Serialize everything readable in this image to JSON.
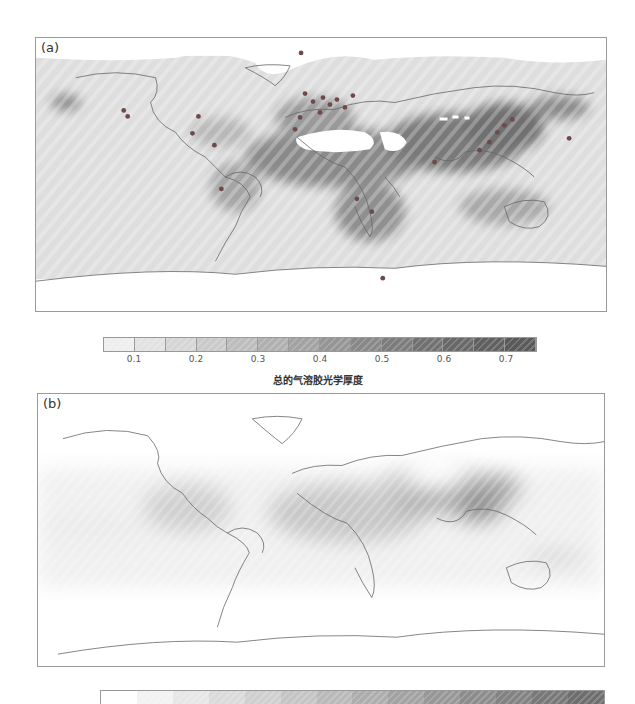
{
  "figure": {
    "panel_a": {
      "label": "(a)",
      "description": "Observed total aerosol optical depth world map with ground station markers",
      "station_color": "#6e4a4a"
    },
    "panel_b": {
      "label": "(b)",
      "description": "Modeled aerosol optical depth world map"
    },
    "colorbar_a": {
      "title": "总的气溶胶光学厚度",
      "ticks": [
        "0.1",
        "0.2",
        "0.3",
        "0.4",
        "0.5",
        "0.6",
        "0.7"
      ],
      "range": [
        0.05,
        0.75
      ],
      "colors": [
        "#eeeeee",
        "#e2e2e2",
        "#d6d6d6",
        "#cacaca",
        "#bdbdbd",
        "#b0b0b0",
        "#a2a2a2",
        "#959595",
        "#888888",
        "#7c7c7c",
        "#717171",
        "#686868",
        "#606060",
        "#595959"
      ]
    },
    "colorbar_b": {
      "colors": [
        "#ffffff",
        "#f2f2f2",
        "#e6e6e6",
        "#dadada",
        "#cfcfcf",
        "#c4c4c4",
        "#b9b9b9",
        "#adadad",
        "#a2a2a2",
        "#979797",
        "#8c8c8c",
        "#828282",
        "#787878",
        "#6e6e6e"
      ]
    }
  },
  "chart_data": {
    "type": "heatmap",
    "title": "",
    "panels": [
      "(a)",
      "(b)"
    ],
    "colorbar_label": "总的气溶胶光学厚度",
    "colorbar_ticks": [
      0.1,
      0.2,
      0.3,
      0.4,
      0.5,
      0.6,
      0.7
    ],
    "colorbar_range": [
      0.05,
      0.75
    ]
  }
}
